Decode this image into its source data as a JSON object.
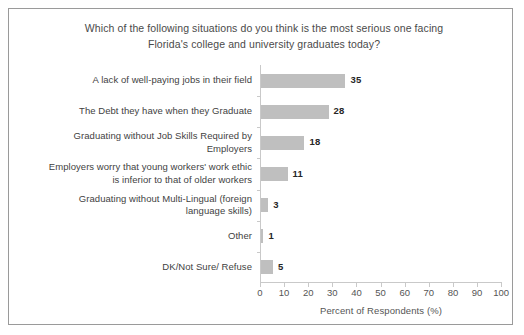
{
  "chart_data": {
    "type": "bar",
    "orientation": "horizontal",
    "title": "Which of the following situations do you think is the most serious one facing Florida's college and university graduates today?",
    "title_line1": "Which of the following situations do you think is the most serious one facing",
    "title_line2": "Florida's college and university graduates today?",
    "categories": [
      "A lack of well-paying jobs in their field",
      "The Debt they have when they Graduate",
      "Graduating without Job Skills Required by Employers",
      "Employers worry that young workers' work ethic is inferior to that of older workers",
      "Graduating without Multi-Lingual (foreign language skills)",
      "Other",
      "DK/Not Sure/ Refuse"
    ],
    "category_lines": [
      [
        "A lack of well-paying jobs in their field"
      ],
      [
        "The Debt they have when they Graduate"
      ],
      [
        "Graduating without Job Skills Required by",
        "Employers"
      ],
      [
        "Employers worry that young workers' work ethic",
        "is inferior to that of older workers"
      ],
      [
        "Graduating without Multi-Lingual (foreign",
        "language skills)"
      ],
      [
        "Other"
      ],
      [
        "DK/Not Sure/ Refuse"
      ]
    ],
    "values": [
      35,
      28,
      18,
      11,
      3,
      1,
      5
    ],
    "value_labels": [
      "35",
      "28",
      "18",
      "11",
      "3",
      "1",
      "5"
    ],
    "xlabel": "Percent of Respondents (%)",
    "ylabel": "",
    "xlim": [
      0,
      100
    ],
    "xticks": [
      0,
      10,
      20,
      30,
      40,
      50,
      60,
      70,
      80,
      90,
      100
    ],
    "xtick_labels": [
      "0",
      "10",
      "20",
      "30",
      "40",
      "50",
      "60",
      "70",
      "80",
      "90",
      "100"
    ],
    "grid": false,
    "legend": false,
    "bar_color": "#BFBFBF",
    "text_color": "#3F3F3F",
    "axis_color": "#C9C9C9",
    "border_color": "#9A9A9A",
    "background": "#FFFFFF"
  }
}
